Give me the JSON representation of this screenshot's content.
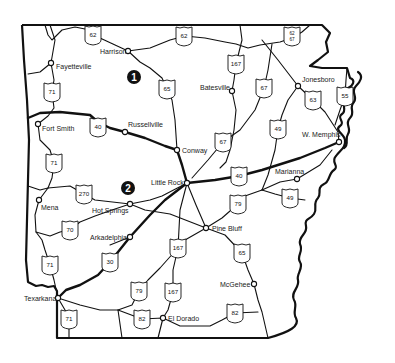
{
  "map": {
    "region": "Arkansas",
    "colors": {
      "ink": "#111111",
      "background": "#ffffff"
    },
    "cities": [
      {
        "id": "harrison",
        "label": "Harrison",
        "x": 128,
        "y": 51,
        "lx": 100,
        "ly": 54
      },
      {
        "id": "fayetteville",
        "label": "Fayetteville",
        "x": 51,
        "y": 63,
        "lx": 56,
        "ly": 69
      },
      {
        "id": "batesville",
        "label": "Batesville",
        "x": 232,
        "y": 91,
        "lx": 200,
        "ly": 90
      },
      {
        "id": "jonesboro",
        "label": "Jonesboro",
        "x": 298,
        "y": 86,
        "lx": 302,
        "ly": 82
      },
      {
        "id": "fort-smith",
        "label": "Fort Smith",
        "x": 38,
        "y": 124,
        "lx": 42,
        "ly": 131
      },
      {
        "id": "russellville",
        "label": "Russellville",
        "x": 125,
        "y": 132,
        "lx": 128,
        "ly": 127
      },
      {
        "id": "conway",
        "label": "Conway",
        "x": 177,
        "y": 150,
        "lx": 182,
        "ly": 153
      },
      {
        "id": "w-memphis",
        "label": "W. Memphis",
        "x": 339,
        "y": 142,
        "lx": 302,
        "ly": 137
      },
      {
        "id": "little-rock",
        "label": "Little Rock",
        "x": 187,
        "y": 183,
        "lx": 151,
        "ly": 185
      },
      {
        "id": "marianna",
        "label": "Marianna",
        "x": 297,
        "y": 179,
        "lx": 275,
        "ly": 174
      },
      {
        "id": "mena",
        "label": "Mena",
        "x": 39,
        "y": 200,
        "lx": 41,
        "ly": 210
      },
      {
        "id": "hot-springs",
        "label": "Hot Springs",
        "x": 130,
        "y": 204,
        "lx": 92,
        "ly": 213
      },
      {
        "id": "pine-bluff",
        "label": "Pine Bluff",
        "x": 206,
        "y": 228,
        "lx": 212,
        "ly": 231
      },
      {
        "id": "arkadelphia",
        "label": "Arkadelphia",
        "x": 130,
        "y": 237,
        "lx": 90,
        "ly": 240
      },
      {
        "id": "mcgehee",
        "label": "McGehee",
        "x": 254,
        "y": 284,
        "lx": 220,
        "ly": 287
      },
      {
        "id": "texarkana",
        "label": "Texarkana",
        "x": 58,
        "y": 298,
        "lx": 24,
        "ly": 301
      },
      {
        "id": "el-dorado",
        "label": "El Dorado",
        "x": 163,
        "y": 318,
        "lx": 168,
        "ly": 321
      }
    ],
    "shields": [
      {
        "route": "62",
        "x": 93,
        "y": 35
      },
      {
        "route": "62",
        "x": 184,
        "y": 36
      },
      {
        "route": "62/67",
        "x": 292,
        "y": 36
      },
      {
        "route": "65",
        "x": 167,
        "y": 89
      },
      {
        "route": "167",
        "x": 236,
        "y": 64
      },
      {
        "route": "67",
        "x": 264,
        "y": 88
      },
      {
        "route": "63",
        "x": 313,
        "y": 100
      },
      {
        "route": "55",
        "x": 345,
        "y": 96
      },
      {
        "route": "71",
        "x": 52,
        "y": 92
      },
      {
        "route": "40",
        "x": 98,
        "y": 127
      },
      {
        "route": "67",
        "x": 223,
        "y": 142
      },
      {
        "route": "49",
        "x": 278,
        "y": 129
      },
      {
        "route": "71",
        "x": 54,
        "y": 163
      },
      {
        "route": "40",
        "x": 239,
        "y": 176
      },
      {
        "route": "270",
        "x": 84,
        "y": 194
      },
      {
        "route": "79",
        "x": 238,
        "y": 204
      },
      {
        "route": "49",
        "x": 290,
        "y": 198
      },
      {
        "route": "70",
        "x": 70,
        "y": 230
      },
      {
        "route": "71",
        "x": 50,
        "y": 265
      },
      {
        "route": "30",
        "x": 110,
        "y": 262
      },
      {
        "route": "167",
        "x": 178,
        "y": 248
      },
      {
        "route": "65",
        "x": 242,
        "y": 253
      },
      {
        "route": "79",
        "x": 139,
        "y": 291
      },
      {
        "route": "167",
        "x": 173,
        "y": 292
      },
      {
        "route": "71",
        "x": 69,
        "y": 319
      },
      {
        "route": "82",
        "x": 142,
        "y": 319
      },
      {
        "route": "82",
        "x": 235,
        "y": 313
      }
    ],
    "markers": [
      {
        "label": "1",
        "x": 134,
        "y": 77
      },
      {
        "label": "2",
        "x": 128,
        "y": 188
      }
    ]
  }
}
